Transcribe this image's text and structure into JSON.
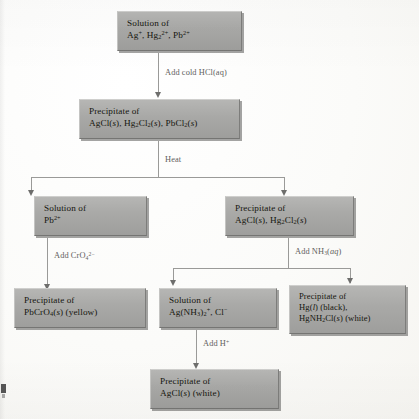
{
  "diagram": {
    "nodes": {
      "start": {
        "line1": "Solution of",
        "line2_html": "Ag+, Hg2 2+, Pb2+",
        "line2_parts": [
          "Ag",
          "+",
          ", Hg",
          "2",
          "2+",
          ", Pb",
          "2+"
        ]
      },
      "chlorides": {
        "line1": "Precipitate of",
        "line2_parts": [
          "AgCl(",
          "s",
          "), Hg",
          "2",
          "Cl",
          "2",
          "(",
          "s",
          "), PbCl",
          "2",
          "(",
          "s",
          ")"
        ]
      },
      "lead_solution": {
        "line1": "Solution of",
        "line2_parts": [
          "Pb",
          "2+"
        ]
      },
      "ag_hg_precipitate": {
        "line1": "Precipitate of",
        "line2_parts": [
          "AgCl(",
          "s",
          "), Hg",
          "2",
          "Cl",
          "2",
          "(",
          "s",
          ")"
        ]
      },
      "lead_chromate": {
        "line1": "Precipitate of",
        "line2_parts": [
          "PbCrO",
          "4",
          "(",
          "s",
          ") (yellow)"
        ]
      },
      "silver_ammine": {
        "line1": "Solution of",
        "line2_parts": [
          "Ag(NH",
          "3",
          ")",
          "2",
          "+",
          ", Cl",
          "-"
        ]
      },
      "mercury_products": {
        "line1": "Precipitate of",
        "line2_parts": [
          "Hg(",
          "l",
          ") (black),"
        ],
        "line3_parts": [
          "HgNH",
          "2",
          "Cl(",
          "s",
          ") (white)"
        ]
      },
      "silver_chloride": {
        "line1": "Precipitate of",
        "line2_parts": [
          "AgCl(",
          "s",
          ") (white)"
        ]
      }
    },
    "edge_labels": {
      "add_hcl": "Add cold HCl(aq)",
      "heat": "Heat",
      "add_chromate": "Add CrO4 2-",
      "add_ammonia": "Add NH3(aq)",
      "add_acid": "Add H+"
    },
    "colors": {
      "box_fill": "#a9a9a7",
      "box_shadow": "#5a5a58",
      "text": "#16160f",
      "connector": "#9a9a98",
      "label_text": "#5f5f5d",
      "page_background": "#fdfdfb"
    }
  }
}
